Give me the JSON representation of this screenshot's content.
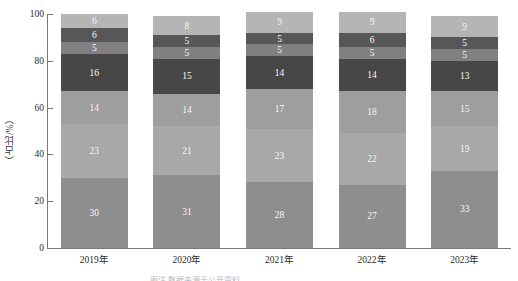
{
  "chart_data": {
    "type": "bar",
    "variant": "stacked",
    "title": "",
    "xlabel": "",
    "ylabel": "（占比/%）",
    "ylim": [
      0,
      100
    ],
    "yticks": [
      0,
      20,
      40,
      60,
      80,
      100
    ],
    "ytick_labels": [
      "0",
      "20",
      "40",
      "60",
      "80",
      "100"
    ],
    "grid": false,
    "legend": "none",
    "categories": [
      "2019年",
      "2020年",
      "2021年",
      "2022年",
      "2023年"
    ],
    "series": [
      {
        "name": "序列1",
        "color": "#8e8e8e",
        "values": [
          30,
          31,
          28,
          27,
          33
        ]
      },
      {
        "name": "序列2",
        "color": "#a8a8a8",
        "values": [
          23,
          21,
          23,
          22,
          19
        ]
      },
      {
        "name": "序列3",
        "color": "#9e9e9e",
        "values": [
          14,
          14,
          17,
          18,
          15
        ]
      },
      {
        "name": "序列4",
        "color": "#474747",
        "values": [
          16,
          15,
          14,
          14,
          13
        ]
      },
      {
        "name": "序列5",
        "color": "#808080",
        "values": [
          5,
          5,
          5,
          5,
          5
        ]
      },
      {
        "name": "序列6",
        "color": "#575757",
        "values": [
          6,
          5,
          5,
          6,
          5
        ]
      },
      {
        "name": "序列7",
        "color": "#b5b5b5",
        "values": [
          6,
          8,
          9,
          9,
          9
        ]
      }
    ],
    "bars": [
      {
        "category": "2019年",
        "total": 100,
        "segments": [
          30,
          23,
          14,
          16,
          5,
          6,
          6
        ]
      },
      {
        "category": "2020年",
        "total": 99,
        "segments": [
          31,
          21,
          14,
          15,
          5,
          5,
          8
        ]
      },
      {
        "category": "2021年",
        "total": 101,
        "segments": [
          28,
          23,
          17,
          14,
          5,
          5,
          9
        ]
      },
      {
        "category": "2022年",
        "total": 101,
        "segments": [
          27,
          22,
          18,
          14,
          5,
          6,
          9
        ]
      },
      {
        "category": "2023年",
        "total": 99,
        "segments": [
          33,
          19,
          15,
          13,
          5,
          5,
          9
        ]
      }
    ]
  },
  "axis": {
    "y_title": "（占比/%）",
    "y_tick_labels": [
      "100",
      "80",
      "60",
      "40",
      "20",
      "0"
    ],
    "x_tick_labels": [
      "2019年",
      "2020年",
      "2021年",
      "2022年",
      "2023年"
    ]
  },
  "colors": {
    "axis_line": "#7a7a7a",
    "text": "#2b2b2b",
    "segment_label": "#ffffff",
    "background": "#ffffff"
  },
  "footer": {
    "cut_off_text": "图注 数据来源于公开资料"
  }
}
